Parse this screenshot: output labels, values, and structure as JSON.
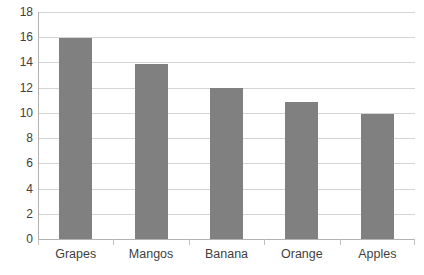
{
  "chart_data": {
    "type": "bar",
    "title": "",
    "subtitle": "",
    "xlabel": "",
    "ylabel": "",
    "categories": [
      "Grapes",
      "Mangos",
      "Banana",
      "Orange",
      "Apples"
    ],
    "values": [
      15.9,
      13.9,
      12.0,
      10.9,
      9.9
    ],
    "series": [
      {
        "name": "",
        "values": [
          15.9,
          13.9,
          12.0,
          10.9,
          9.9
        ]
      }
    ],
    "ylim": [
      0,
      18
    ],
    "ytick_values": [
      0,
      2,
      4,
      6,
      8,
      10,
      12,
      14,
      16,
      18
    ],
    "ytick_labels": [
      "0",
      "2",
      "4",
      "6",
      "8",
      "10",
      "12",
      "14",
      "16",
      "18"
    ],
    "grid": true,
    "grid_axis": "y",
    "legend": false,
    "legend_position": "none",
    "annotations": [],
    "colors": {
      "bar_fill": "#808080",
      "gridline": "#d4d4d4",
      "axis_line": "#b3b3b3",
      "background": "#ffffff",
      "tick_label": "#3f3f3f"
    }
  }
}
